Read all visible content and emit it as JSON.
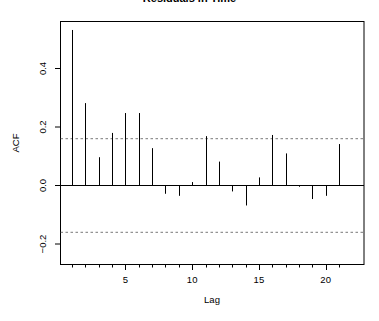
{
  "chart_data": {
    "type": "bar",
    "subtype": "acf-stem",
    "title": "Residuals in Time",
    "xlabel": "Lag",
    "ylabel": "ACF",
    "x": [
      1,
      2,
      3,
      4,
      5,
      6,
      7,
      8,
      9,
      10,
      11,
      12,
      13,
      14,
      15,
      16,
      17,
      18,
      19,
      20,
      21
    ],
    "values": [
      0.53,
      0.28,
      0.095,
      0.178,
      0.246,
      0.246,
      0.126,
      -0.03,
      -0.037,
      0.01,
      0.167,
      0.08,
      -0.022,
      -0.07,
      0.026,
      0.171,
      0.108,
      -0.006,
      -0.048,
      -0.037,
      0.14
    ],
    "confidence_bound": 0.16,
    "xlim": [
      0.1,
      21.9
    ],
    "ylim": [
      -0.27,
      0.56
    ],
    "x_ticks": [
      5,
      10,
      15,
      20
    ],
    "x_tick_labels": [
      "5",
      "10",
      "15",
      "20"
    ],
    "y_ticks": [
      -0.2,
      0.0,
      0.2,
      0.4
    ],
    "y_tick_labels": [
      "-0.2",
      "0.0",
      "0.2",
      "0.4"
    ],
    "grid": false,
    "legend": null
  }
}
